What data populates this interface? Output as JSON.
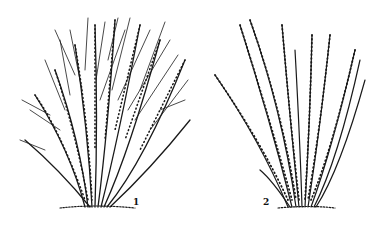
{
  "figure": {
    "panels": [
      {
        "label": "1",
        "subject": "dense, multi-branched bushy shrub"
      },
      {
        "label": "2",
        "subject": "sparse shrub with long straight upright canes"
      }
    ],
    "colors": {
      "ink": "#1a1a1a",
      "background": "#ffffff"
    }
  }
}
